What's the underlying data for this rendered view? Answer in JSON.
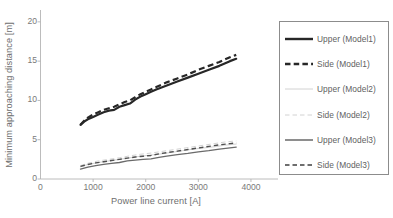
{
  "chart_data": {
    "type": "line",
    "title": "",
    "xlabel": "Power line current [A]",
    "ylabel": "Minimum approaching distance [m]",
    "xlim": [
      0,
      4400
    ],
    "ylim": [
      0,
      21
    ],
    "xticks": [
      0,
      1000,
      2000,
      3000,
      4000
    ],
    "yticks": [
      0,
      5,
      10,
      15,
      20
    ],
    "grid": false,
    "legend_position": "right-outside",
    "series": [
      {
        "name": "Upper (Model1)",
        "style": "solid",
        "color": "#272727",
        "width": 2.2,
        "x": [
          760,
          830,
          900,
          1000,
          1100,
          1200,
          1300,
          1400,
          1500,
          1600,
          1700,
          1800,
          1900,
          2000,
          2100,
          2200,
          2400,
          2600,
          2800,
          3000,
          3200,
          3400,
          3600,
          3720
        ],
        "y": [
          6.9,
          7.3,
          7.6,
          7.9,
          8.2,
          8.5,
          8.7,
          8.8,
          9.2,
          9.4,
          9.6,
          10.1,
          10.5,
          10.8,
          11.1,
          11.4,
          11.9,
          12.4,
          12.9,
          13.4,
          13.9,
          14.4,
          15.0,
          15.3
        ]
      },
      {
        "name": "Side (Model1)",
        "style": "dashed",
        "color": "#272727",
        "width": 2.2,
        "x": [
          760,
          830,
          900,
          1000,
          1100,
          1200,
          1300,
          1400,
          1500,
          1600,
          1700,
          1800,
          1900,
          2000,
          2100,
          2200,
          2400,
          2600,
          2800,
          3000,
          3200,
          3400,
          3600,
          3720
        ],
        "y": [
          6.9,
          7.4,
          7.8,
          8.2,
          8.5,
          8.8,
          9.0,
          9.2,
          9.5,
          9.8,
          10.0,
          10.4,
          10.8,
          11.1,
          11.4,
          11.7,
          12.3,
          12.8,
          13.3,
          13.9,
          14.4,
          14.9,
          15.5,
          15.8
        ]
      },
      {
        "name": "Upper (Model2)",
        "style": "solid",
        "color": "#d2d2d2",
        "width": 1.0,
        "x": [
          760,
          900,
          1100,
          1300,
          1500,
          1700,
          1900,
          2100,
          2300,
          2500,
          2700,
          2900,
          3100,
          3300,
          3500,
          3720
        ],
        "y": [
          1.55,
          1.85,
          2.1,
          2.3,
          2.5,
          2.7,
          2.9,
          3.05,
          3.2,
          3.4,
          3.6,
          3.8,
          3.95,
          4.1,
          4.3,
          4.45
        ]
      },
      {
        "name": "Side (Model2)",
        "style": "dashed",
        "color": "#d2d2d2",
        "width": 1.0,
        "x": [
          760,
          900,
          1100,
          1300,
          1500,
          1700,
          1900,
          2100,
          2300,
          2500,
          2700,
          2900,
          3100,
          3300,
          3500,
          3720
        ],
        "y": [
          1.7,
          2.0,
          2.3,
          2.5,
          2.7,
          2.95,
          3.15,
          3.3,
          3.5,
          3.7,
          3.9,
          4.1,
          4.3,
          4.5,
          4.7,
          4.85
        ]
      },
      {
        "name": "Upper (Model3)",
        "style": "solid",
        "color": "#6a6a6a",
        "width": 1.3,
        "x": [
          760,
          900,
          1050,
          1200,
          1350,
          1500,
          1650,
          1800,
          1950,
          2100,
          2250,
          2400,
          2600,
          2800,
          3000,
          3200,
          3400,
          3600,
          3720
        ],
        "y": [
          1.25,
          1.5,
          1.7,
          1.85,
          2.0,
          2.1,
          2.3,
          2.4,
          2.5,
          2.55,
          2.75,
          2.9,
          3.1,
          3.25,
          3.45,
          3.6,
          3.8,
          3.95,
          4.05
        ]
      },
      {
        "name": "Side (Model3)",
        "style": "dashed",
        "color": "#4f4f4f",
        "width": 1.4,
        "x": [
          760,
          900,
          1050,
          1200,
          1350,
          1500,
          1650,
          1800,
          1950,
          2100,
          2250,
          2400,
          2600,
          2800,
          3000,
          3200,
          3400,
          3600,
          3720
        ],
        "y": [
          1.6,
          1.85,
          2.05,
          2.2,
          2.35,
          2.5,
          2.65,
          2.8,
          2.9,
          3.0,
          3.2,
          3.35,
          3.55,
          3.75,
          3.95,
          4.15,
          4.35,
          4.5,
          4.6
        ]
      }
    ]
  },
  "legend": {
    "items": [
      {
        "label": "Upper (Model1)",
        "style": "solid",
        "color": "#272727",
        "width": 2.4
      },
      {
        "label": "Side (Model1)",
        "style": "dashed",
        "color": "#272727",
        "width": 2.4
      },
      {
        "label": "Upper (Model2)",
        "style": "solid",
        "color": "#d2d2d2",
        "width": 1.0
      },
      {
        "label": "Side (Model2)",
        "style": "dashed",
        "color": "#d2d2d2",
        "width": 1.0
      },
      {
        "label": "Upper (Model3)",
        "style": "solid",
        "color": "#5e5e5e",
        "width": 1.4
      },
      {
        "label": "Side (Model3)",
        "style": "dashed",
        "color": "#3f3f3f",
        "width": 1.6
      }
    ]
  },
  "axis": {
    "line_color": "#b4b4b4",
    "tick_color": "#b4b4b4"
  }
}
